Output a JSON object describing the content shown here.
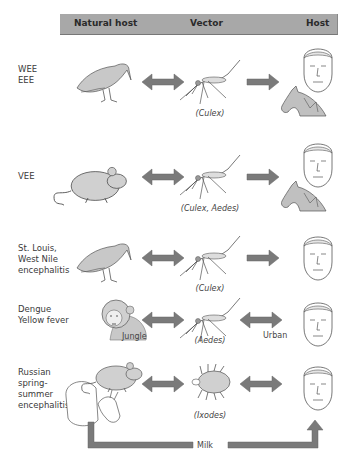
{
  "header": {
    "natural_host": "Natural host",
    "vector": "Vector",
    "host": "Host",
    "background_color": "#a8a8a8"
  },
  "rows": [
    {
      "disease": [
        "WEE",
        "EEE"
      ],
      "natural_host": "bird",
      "vector": "mosquito",
      "vector_label": "(Culex)",
      "host_arrow": "one-way",
      "hosts": [
        "human",
        "horse"
      ]
    },
    {
      "disease": [
        "VEE"
      ],
      "natural_host": "rodent",
      "vector": "mosquito",
      "vector_label": "(Culex, Aedes)",
      "host_arrow": "one-way",
      "hosts": [
        "human",
        "horse"
      ]
    },
    {
      "disease": [
        "St. Louis,",
        "West Nile",
        "encephalitis"
      ],
      "natural_host": "bird",
      "vector": "mosquito",
      "vector_label": "(Culex)",
      "host_arrow": "one-way",
      "hosts": [
        "human"
      ]
    },
    {
      "disease": [
        "Dengue",
        "Yellow fever"
      ],
      "natural_host": "monkey",
      "natural_host_label": "Jungle",
      "vector": "mosquito",
      "vector_label": "(Aedes)",
      "host_arrow": "two-way",
      "host_arrow_label": "Urban",
      "hosts": [
        "human"
      ]
    },
    {
      "disease": [
        "Russian",
        "spring-",
        "summer",
        "encephalitis"
      ],
      "natural_host": "rodent, sheep, goat",
      "vector": "tick",
      "vector_label": "(Ixodes)",
      "host_arrow": "two-way",
      "hosts": [
        "human"
      ],
      "bypass_label": "Milk"
    }
  ],
  "colors": {
    "arrow": "#7a7a7a",
    "animal_fill": "#c8c8c8",
    "line": "#555555"
  }
}
